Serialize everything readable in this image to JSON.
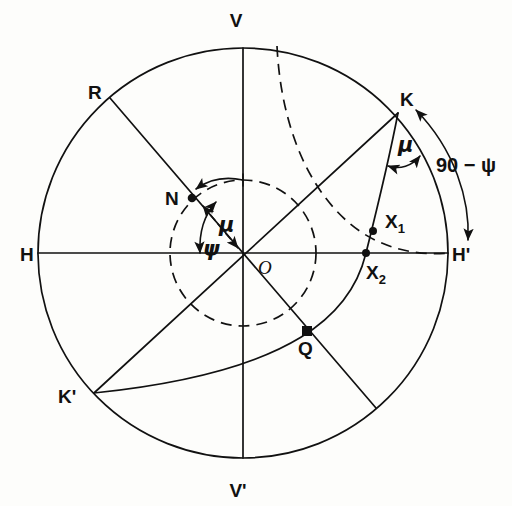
{
  "figure": {
    "background_color": "#fdfdfb",
    "ink_color": "#111111"
  },
  "geometry": {
    "center": {
      "x": 243,
      "y": 253
    },
    "outer_radius": 205,
    "inner_dashed_radius": 73
  },
  "labels": {
    "V": "V",
    "V_prime": "V'",
    "H": "H",
    "H_prime": "H'",
    "R": "R",
    "K": "K",
    "K_prime": "K'",
    "N": "N",
    "O": "O",
    "Q": "Q",
    "X1_base": "X",
    "X1_sub": "1",
    "X2_base": "X",
    "X2_sub": "2",
    "mu_center": "μ",
    "mu_at_k": "μ",
    "psi_center": "ψ",
    "angle_90_minus_psi": "90 − ψ"
  },
  "points": {
    "V": {
      "x": 243,
      "y": 48,
      "label_x": 236,
      "label_y": 27
    },
    "V_prime": {
      "x": 243,
      "y": 458,
      "label_x": 234,
      "label_y": 495
    },
    "H": {
      "x": 38,
      "y": 253,
      "label_x": 18,
      "label_y": 261
    },
    "H_prime": {
      "x": 448,
      "y": 253,
      "label_x": 452,
      "label_y": 261
    },
    "R": {
      "x": 110,
      "y": 98,
      "label_x": 90,
      "label_y": 92
    },
    "K": {
      "x": 398,
      "y": 113,
      "label_x": 402,
      "label_y": 108
    },
    "K_prime": {
      "x": 94,
      "y": 393,
      "label_x": 60,
      "label_y": 400
    },
    "N": {
      "x": 192,
      "y": 198,
      "label_x": 168,
      "label_y": 203
    },
    "O": {
      "x": 243,
      "y": 253,
      "label_x": 258,
      "label_y": 272
    },
    "Q": {
      "x": 307,
      "y": 331,
      "label_x": 300,
      "label_y": 352
    },
    "X1": {
      "x": 373,
      "y": 231,
      "label_x": 385,
      "label_y": 227
    },
    "X2": {
      "x": 366,
      "y": 253,
      "label_x": 368,
      "label_y": 276
    }
  },
  "annotations": {
    "mu_center_label": {
      "x": 220,
      "y": 224
    },
    "psi_center_label": {
      "x": 205,
      "y": 248
    },
    "mu_at_k_label": {
      "x": 400,
      "y": 150
    },
    "angle_90_label": {
      "x": 438,
      "y": 170
    }
  },
  "markers": {
    "N": "filled-circle",
    "X1": "filled-circle",
    "X2": "filled-circle",
    "Q": "filled-square"
  },
  "lines": [
    {
      "name": "horizontal-axis-H-Hprime",
      "from": "H",
      "to": "H_prime",
      "style": "solid"
    },
    {
      "name": "vertical-axis-V-Vprime",
      "from": "V",
      "to": "V_prime",
      "style": "solid"
    },
    {
      "name": "diameter-R-to-Q-extension",
      "from": "R",
      "to": "lower-right-rim",
      "style": "solid"
    },
    {
      "name": "diameter-K-to-Kprime",
      "from": "K",
      "to": "K_prime",
      "style": "solid"
    }
  ],
  "curves": [
    {
      "name": "great-circle-K-X1-X2-Q-Kprime",
      "style": "solid",
      "endpoints": [
        "K",
        "K_prime"
      ]
    },
    {
      "name": "dashed-great-circle-V-X1-Hprime",
      "style": "dashed",
      "endpoints": [
        "V",
        "H_prime"
      ]
    },
    {
      "name": "inner-dashed-circle",
      "style": "dashed",
      "endpoints": []
    },
    {
      "name": "arc-90-minus-psi",
      "style": "solid-double-arrow",
      "endpoints": [
        "K",
        "H_prime"
      ]
    },
    {
      "name": "arc-mu-at-center",
      "style": "solid-arrow",
      "endpoints": []
    },
    {
      "name": "arc-psi-at-center",
      "style": "solid-arrow",
      "endpoints": []
    },
    {
      "name": "arc-mu-at-K",
      "style": "solid-arrow",
      "endpoints": []
    },
    {
      "name": "double-arrow-mu-along-ON",
      "style": "dashed-double-arrow",
      "endpoints": [
        "O",
        "N"
      ]
    }
  ]
}
